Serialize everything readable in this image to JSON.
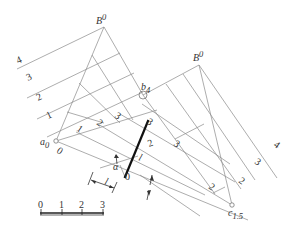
{
  "diagram": {
    "type": "descriptive-geometry-construction",
    "labels": {
      "B_left": "B",
      "B_left_sup": "0",
      "B_right": "B",
      "B_right_sup": "0",
      "b4": "b",
      "b4_sub": "4",
      "a0": "a",
      "a0_sub": "0",
      "c15": "c",
      "c15_sub": "1.5",
      "alpha": "α",
      "l_left": "l",
      "l_center": "l"
    },
    "left_contour_labels": [
      "4",
      "3",
      "2",
      "1"
    ],
    "inner_grade_labels_left": [
      "0",
      "1",
      "2",
      "3"
    ],
    "thick_line_labels": [
      "0",
      "1",
      "2",
      "3"
    ],
    "right_side_labels": [
      "3",
      "3",
      "2",
      "2",
      "3",
      "4"
    ],
    "scale_bar": {
      "ticks": [
        "0",
        "1",
        "2",
        "3"
      ]
    }
  }
}
